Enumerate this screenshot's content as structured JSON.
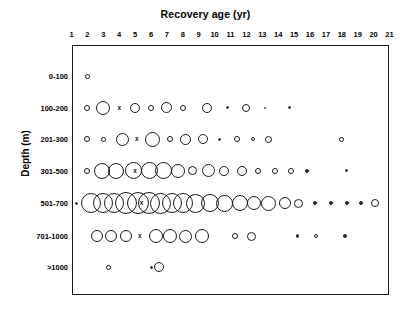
{
  "chart_data": {
    "type": "scatter",
    "title": "Recovery age (yr)",
    "xlabel": "Recovery age (yr)",
    "ylabel": "Depth (m)",
    "xlim": [
      1,
      21
    ],
    "x_ticks": [
      1,
      2,
      3,
      4,
      5,
      6,
      7,
      8,
      9,
      10,
      11,
      12,
      13,
      14,
      15,
      16,
      17,
      18,
      19,
      20,
      21
    ],
    "y_categories": [
      "0-100",
      "100-200",
      "201-300",
      "301-500",
      "501-700",
      "701-1000",
      ">1000"
    ],
    "grid": false,
    "legend": null,
    "marker_style": "open circle, area proportional to count",
    "series": [
      {
        "name": "0-100",
        "row": 0,
        "points": [
          {
            "x": 2,
            "size": 5
          }
        ]
      },
      {
        "name": "100-200",
        "row": 1,
        "points": [
          {
            "x": 2,
            "size": 6
          },
          {
            "x": 3,
            "size": 14
          },
          {
            "x": 4,
            "size": 10,
            "marked": true
          },
          {
            "x": 5,
            "size": 10
          },
          {
            "x": 6,
            "size": 6
          },
          {
            "x": 7,
            "size": 11
          },
          {
            "x": 8,
            "size": 6
          },
          {
            "x": 9.5,
            "size": 10
          },
          {
            "x": 10.8,
            "size": 3.5,
            "filled": true
          },
          {
            "x": 12,
            "size": 8
          },
          {
            "x": 13.2,
            "size": 2,
            "filled": true
          },
          {
            "x": 14.7,
            "size": 3,
            "filled": true
          }
        ]
      },
      {
        "name": "201-300",
        "row": 2,
        "points": [
          {
            "x": 2,
            "size": 6
          },
          {
            "x": 3,
            "size": 5
          },
          {
            "x": 4.2,
            "size": 13
          },
          {
            "x": 5.1,
            "size": 11,
            "marked": true
          },
          {
            "x": 6.1,
            "size": 15
          },
          {
            "x": 7.2,
            "size": 6
          },
          {
            "x": 8.2,
            "size": 11
          },
          {
            "x": 9.3,
            "size": 10
          },
          {
            "x": 10.3,
            "size": 3,
            "filled": true
          },
          {
            "x": 11.4,
            "size": 6
          },
          {
            "x": 12.4,
            "size": 4
          },
          {
            "x": 13.4,
            "size": 7
          },
          {
            "x": 18,
            "size": 5
          }
        ]
      },
      {
        "name": "301-500",
        "row": 3,
        "points": [
          {
            "x": 2,
            "size": 6
          },
          {
            "x": 2.9,
            "size": 16
          },
          {
            "x": 3.8,
            "size": 16
          },
          {
            "x": 4.9,
            "size": 17
          },
          {
            "x": 5.0,
            "size": 11,
            "marked": true
          },
          {
            "x": 5.9,
            "size": 17
          },
          {
            "x": 6.8,
            "size": 17
          },
          {
            "x": 7.7,
            "size": 14
          },
          {
            "x": 8.6,
            "size": 9
          },
          {
            "x": 9.6,
            "size": 13
          },
          {
            "x": 10.6,
            "size": 10
          },
          {
            "x": 11.7,
            "size": 10
          },
          {
            "x": 12.7,
            "size": 6
          },
          {
            "x": 13.8,
            "size": 6
          },
          {
            "x": 14.8,
            "size": 6
          },
          {
            "x": 15.8,
            "size": 4,
            "filled": true
          },
          {
            "x": 18.3,
            "size": 3.5,
            "filled": true
          }
        ]
      },
      {
        "name": "501-700",
        "row": 4,
        "points": [
          {
            "x": 1.3,
            "size": 3,
            "filled": true
          },
          {
            "x": 2.2,
            "size": 20
          },
          {
            "x": 3.0,
            "size": 20
          },
          {
            "x": 3.7,
            "size": 20
          },
          {
            "x": 4.4,
            "size": 22
          },
          {
            "x": 5.2,
            "size": 22
          },
          {
            "x": 5.4,
            "size": 9,
            "marked": true
          },
          {
            "x": 5.9,
            "size": 22
          },
          {
            "x": 6.6,
            "size": 21
          },
          {
            "x": 7.3,
            "size": 20
          },
          {
            "x": 8.0,
            "size": 20
          },
          {
            "x": 8.8,
            "size": 19
          },
          {
            "x": 9.7,
            "size": 18
          },
          {
            "x": 10.6,
            "size": 17
          },
          {
            "x": 11.6,
            "size": 16
          },
          {
            "x": 12.5,
            "size": 14
          },
          {
            "x": 13.4,
            "size": 15
          },
          {
            "x": 14.4,
            "size": 12
          },
          {
            "x": 15.3,
            "size": 9
          },
          {
            "x": 16.3,
            "size": 4,
            "filled": true
          },
          {
            "x": 17.3,
            "size": 4,
            "filled": true
          },
          {
            "x": 18.3,
            "size": 4,
            "filled": true
          },
          {
            "x": 19.2,
            "size": 4,
            "filled": true
          },
          {
            "x": 20.1,
            "size": 8
          }
        ]
      },
      {
        "name": "701-1000",
        "row": 5,
        "points": [
          {
            "x": 2.6,
            "size": 12
          },
          {
            "x": 3.5,
            "size": 12
          },
          {
            "x": 4.4,
            "size": 12
          },
          {
            "x": 5.3,
            "size": 12,
            "marked": true
          },
          {
            "x": 6.3,
            "size": 14
          },
          {
            "x": 7.2,
            "size": 14
          },
          {
            "x": 8.2,
            "size": 13
          },
          {
            "x": 9.2,
            "size": 14
          },
          {
            "x": 11.3,
            "size": 6
          },
          {
            "x": 12.3,
            "size": 9
          },
          {
            "x": 15.2,
            "size": 3.5,
            "filled": true
          },
          {
            "x": 16.4,
            "size": 4
          },
          {
            "x": 18.2,
            "size": 3.5,
            "filled": true
          }
        ]
      },
      {
        "name": ">1000",
        "row": 6,
        "points": [
          {
            "x": 3.3,
            "size": 5
          },
          {
            "x": 6.0,
            "size": 3,
            "filled": true
          },
          {
            "x": 6.5,
            "size": 10
          }
        ]
      }
    ]
  },
  "axes": {
    "x_title": "Recovery age (yr)",
    "y_title": "Depth (m)",
    "x_tick_labels": [
      "1",
      "2",
      "3",
      "4",
      "5",
      "6",
      "7",
      "8",
      "9",
      "10",
      "11",
      "12",
      "13",
      "14",
      "15",
      "16",
      "17",
      "18",
      "19",
      "20",
      "21"
    ],
    "y_tick_labels": [
      "0-100",
      "100-200",
      "201-300",
      "301-500",
      "501-700",
      "701-1000",
      ">1000"
    ]
  }
}
